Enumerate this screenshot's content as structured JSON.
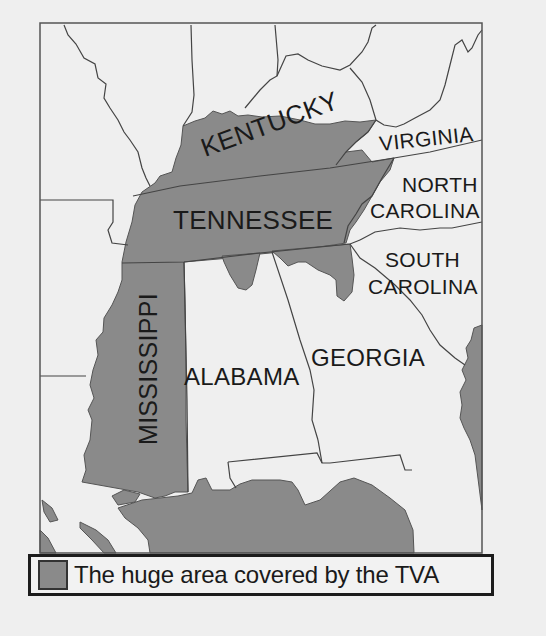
{
  "map": {
    "colors": {
      "tva_shade": "#8a8a8a",
      "land": "#efefef",
      "border_line": "#444444",
      "frame": "#555555",
      "label": "#1a1a1a"
    },
    "labels": {
      "kentucky": "KENTUCKY",
      "virginia": "VIRGINIA",
      "tennessee": "TENNESSEE",
      "north_carolina_line1": "NORTH",
      "north_carolina_line2": "CAROLINA",
      "south_carolina_line1": "SOUTH",
      "south_carolina_line2": "CAROLINA",
      "mississippi": "MISSISSIPPI",
      "alabama": "ALABAMA",
      "georgia": "GEORGIA"
    }
  },
  "legend": {
    "swatch_icon": "gray-square-swatch",
    "text": "The huge area covered by the TVA"
  }
}
